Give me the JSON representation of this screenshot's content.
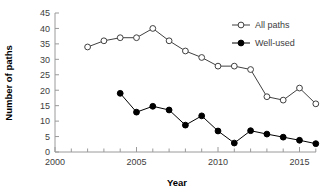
{
  "chart_data": {
    "type": "line",
    "title": "",
    "xlabel": "Year",
    "ylabel": "Number of paths",
    "xlim": [
      2000,
      2016.8
    ],
    "ylim": [
      0,
      45
    ],
    "ytick_step": 5,
    "yticks": [
      "0",
      "5",
      "10",
      "15",
      "20",
      "25",
      "30",
      "35",
      "40",
      "45"
    ],
    "xticks_major": [
      "2000",
      "2005",
      "2010",
      "2015"
    ],
    "xticks_minor": [
      2001,
      2002,
      2003,
      2004,
      2006,
      2007,
      2008,
      2009,
      2011,
      2012,
      2013,
      2014,
      2016
    ],
    "grid": false,
    "legend_position": "top-right",
    "series": [
      {
        "name": "All paths",
        "marker": "open-circle",
        "color": "#404040",
        "x": [
          2002,
          2003,
          2004,
          2005,
          2006,
          2007,
          2008,
          2009,
          2010,
          2011,
          2012,
          2013,
          2014,
          2015,
          2016
        ],
        "values": [
          34,
          36,
          37,
          37,
          40,
          36,
          32.7,
          30.6,
          27.8,
          27.8,
          26.7,
          17.9,
          16.8,
          20.7,
          15.6
        ]
      },
      {
        "name": "Well-used",
        "marker": "filled-circle",
        "color": "#000000",
        "x": [
          2004,
          2005,
          2006,
          2007,
          2008,
          2009,
          2010,
          2011,
          2012,
          2013,
          2014,
          2015,
          2016
        ],
        "values": [
          19,
          12.9,
          14.8,
          13.6,
          8.7,
          11.7,
          6.8,
          2.9,
          6.9,
          5.8,
          4.8,
          3.8,
          2.7
        ]
      }
    ]
  }
}
